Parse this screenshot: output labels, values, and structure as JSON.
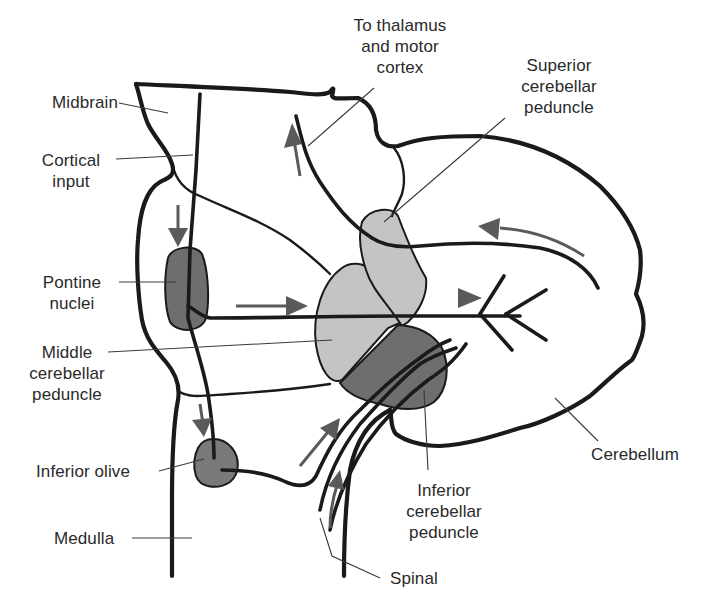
{
  "diagram": {
    "colors": {
      "outline": "#1a1a1a",
      "label_text": "#2a2a2a",
      "flow_arrow": "#5a5a5a",
      "light_region": "#c4c4c4",
      "dark_region": "#6e6e6e",
      "background": "#ffffff"
    },
    "labels": {
      "midbrain": "Midbrain",
      "cortical_input": "Cortical\ninput",
      "pontine_nuclei": "Pontine\nnuclei",
      "middle_cerebellar_peduncle": "Middle\ncerebellar\npeduncle",
      "inferior_olive": "Inferior olive",
      "medulla": "Medulla",
      "to_thalamus": "To thalamus\nand motor\ncortex",
      "superior_cerebellar_peduncle": "Superior\ncerebellar\npeduncle",
      "cerebellum": "Cerebellum",
      "inferior_cerebellar_peduncle": "Inferior\ncerebellar\npeduncle",
      "spinal": "Spinal"
    },
    "structures": [
      {
        "id": "midbrain",
        "label": "Midbrain",
        "shade": "none"
      },
      {
        "id": "pontine_nuclei",
        "label": "Pontine nuclei",
        "shade": "dark"
      },
      {
        "id": "middle_cerebellar_peduncle",
        "label": "Middle cerebellar peduncle",
        "shade": "light"
      },
      {
        "id": "superior_cerebellar_peduncle",
        "label": "Superior cerebellar peduncle",
        "shade": "light"
      },
      {
        "id": "inferior_cerebellar_peduncle",
        "label": "Inferior cerebellar peduncle",
        "shade": "dark"
      },
      {
        "id": "inferior_olive",
        "label": "Inferior olive",
        "shade": "dark"
      },
      {
        "id": "medulla",
        "label": "Medulla",
        "shade": "none"
      },
      {
        "id": "cerebellum",
        "label": "Cerebellum",
        "shade": "none"
      }
    ],
    "pathways": [
      {
        "from": "Cortical input",
        "to": "Pontine nuclei",
        "direction": "down"
      },
      {
        "from": "Pontine nuclei",
        "to": "Cerebellum",
        "via": "Middle cerebellar peduncle",
        "direction": "right"
      },
      {
        "from": "Inferior olive",
        "to": "Cerebellum",
        "via": "Inferior cerebellar peduncle",
        "direction": "up"
      },
      {
        "from": "Spinal",
        "to": "Cerebellum",
        "via": "Inferior cerebellar peduncle",
        "direction": "up"
      },
      {
        "from": "Cerebellum",
        "to": "To thalamus and motor cortex",
        "via": "Superior cerebellar peduncle",
        "direction": "up"
      }
    ]
  }
}
